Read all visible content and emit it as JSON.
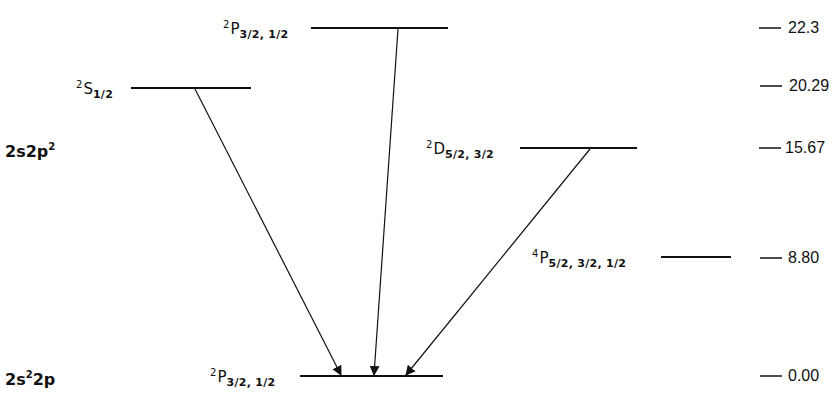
{
  "diagram": {
    "type": "energy-level-diagram",
    "configurations": [
      {
        "id": "upper",
        "label_main": "2s2p",
        "label_sup": "2",
        "y": 150
      },
      {
        "id": "ground",
        "label_main1": "2s",
        "label_sup": "2",
        "label_main2": "2p",
        "y": 378
      }
    ],
    "levels": [
      {
        "id": "2P-upper",
        "mult": "2",
        "letter": "P",
        "j": "3/2, 1/2",
        "energy": "22.3",
        "y": 28,
        "x1": 311,
        "x2": 448
      },
      {
        "id": "2S",
        "mult": "2",
        "letter": "S",
        "j": "1/2",
        "energy": "20.29",
        "y": 88,
        "x1": 131,
        "x2": 251
      },
      {
        "id": "2D",
        "mult": "2",
        "letter": "D",
        "j": "5/2, 3/2",
        "energy": "15.67",
        "y": 148,
        "x1": 520,
        "x2": 637
      },
      {
        "id": "4P",
        "mult": "4",
        "letter": "P",
        "j": "5/2, 3/2, 1/2",
        "energy": "8.80",
        "y": 257,
        "x1": 661,
        "x2": 731
      },
      {
        "id": "2P-ground",
        "mult": "2",
        "letter": "P",
        "j": "3/2, 1/2",
        "energy": "0.00",
        "y": 376,
        "x1": 300,
        "x2": 443
      }
    ],
    "transitions": [
      {
        "from": "2S",
        "to": "2P-ground",
        "x1": 195,
        "y1": 88,
        "x2": 341,
        "y2": 375
      },
      {
        "from": "2P-upper",
        "to": "2P-ground",
        "x1": 398,
        "y1": 28,
        "x2": 374,
        "y2": 375
      },
      {
        "from": "2D",
        "to": "2P-ground",
        "x1": 590,
        "y1": 148,
        "x2": 406,
        "y2": 375
      }
    ],
    "scale": [
      {
        "value": "22.3",
        "y": 28
      },
      {
        "value": "20.29",
        "y": 86
      },
      {
        "value": "15.67",
        "y": 148
      },
      {
        "value": "8.80",
        "y": 258
      },
      {
        "value": "0.00",
        "y": 376
      }
    ],
    "colors": {
      "ink": "#111111",
      "background": "#ffffff"
    }
  }
}
